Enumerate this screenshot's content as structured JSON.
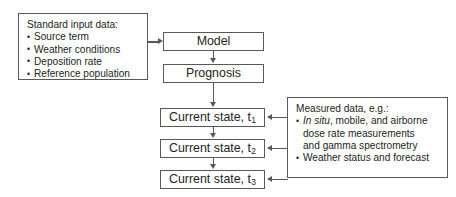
{
  "diagram": {
    "colors": {
      "stroke": "#58595b",
      "text": "#231f20",
      "background": "#ffffff"
    },
    "input_panel": {
      "heading": "Standard input data:",
      "items": [
        "Source term",
        "Weather conditions",
        "Deposition rate",
        "Reference population"
      ]
    },
    "flow": {
      "model": "Model",
      "prognosis": "Prognosis",
      "state_1_label": "Current state, t",
      "state_1_sub": "1",
      "state_2_label": "Current state, t",
      "state_2_sub": "2",
      "state_3_label": "Current state, t",
      "state_3_sub": "3"
    },
    "measured_panel": {
      "heading": "Measured data, e.g.:",
      "item_1_italic": "In situ",
      "item_1_rest": ", mobile, and airborne",
      "item_1_line2": "dose rate measurements",
      "item_1_line3": "and gamma spectrometry",
      "item_2": "Weather status and forecast"
    }
  }
}
